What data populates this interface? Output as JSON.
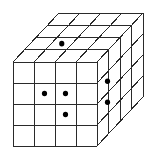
{
  "diagram": {
    "type": "cube-grid",
    "grid_size": 4,
    "faces": [
      "front",
      "top",
      "right"
    ],
    "colors": {
      "line": "#2a2a2a",
      "dot": "#000000",
      "background": "#ffffff"
    },
    "geometry": {
      "front": {
        "x0": 13,
        "y0": 62,
        "cell": 21
      },
      "depth_offset": {
        "dx": 46,
        "dy": -49
      }
    },
    "dots": {
      "top": [
        {
          "col": 1,
          "row": 2
        }
      ],
      "front": [
        {
          "col": 1,
          "row": 1
        },
        {
          "col": 2,
          "row": 1
        },
        {
          "col": 2,
          "row": 2
        }
      ],
      "right": [
        {
          "depth": 1,
          "row": 1
        },
        {
          "depth": 1,
          "row": 2
        }
      ]
    }
  }
}
